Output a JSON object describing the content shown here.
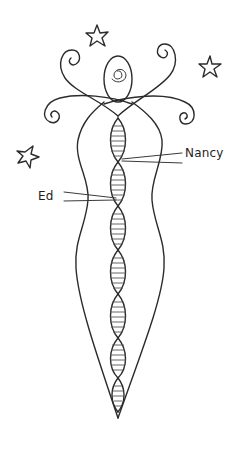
{
  "figure": {
    "ink_color": "#2b2b2b",
    "background": "#ffffff"
  },
  "labels": [
    {
      "id": "nancy",
      "text": "Nancy",
      "x": 185,
      "y": 146
    },
    {
      "id": "ed",
      "text": "Ed",
      "x": 38,
      "y": 188
    }
  ],
  "decorations": {
    "stars": [
      {
        "name": "star-top",
        "cx": 97,
        "cy": 36
      },
      {
        "name": "star-right",
        "cx": 209,
        "cy": 67
      },
      {
        "name": "star-left",
        "cx": 28,
        "cy": 156
      }
    ],
    "spirals": [
      "head-spiral",
      "upper-left-tendril",
      "upper-right-tendril",
      "lower-left-tendril",
      "lower-right-tendril"
    ]
  },
  "helix": {
    "segments": 8,
    "top_y": 118,
    "bottom_y": 418
  }
}
